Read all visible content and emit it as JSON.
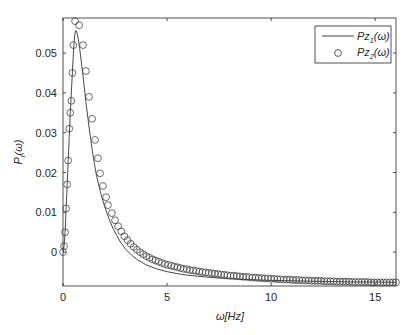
{
  "chart_data": {
    "type": "line",
    "title": "",
    "xlabel": "ω[Hz]",
    "ylabel": "P_i(ω)",
    "xlim": [
      0,
      16
    ],
    "ylim": [
      -0.0085,
      0.0588
    ],
    "xticks": [
      0,
      5,
      10,
      15
    ],
    "xtick_labels": [
      "0",
      "5",
      "10",
      "15"
    ],
    "yticks": [
      0,
      0.01,
      0.02,
      0.03,
      0.04,
      0.05
    ],
    "ytick_labels": [
      "0",
      "0.01",
      "0.02",
      "0.03",
      "0.04",
      "0.05"
    ],
    "grid": false,
    "legend_position": "upper right",
    "series": [
      {
        "name": "Pz1(ω)",
        "label_main": "Pz",
        "label_sub": "1",
        "label_tail": "(ω)",
        "style": "line",
        "color": "#333333",
        "x": [
          0,
          0.05,
          0.1,
          0.15,
          0.2,
          0.25,
          0.3,
          0.35,
          0.4,
          0.45,
          0.5,
          0.55,
          0.6,
          0.65,
          0.7,
          0.75,
          0.8,
          0.9,
          1.0,
          1.1,
          1.2,
          1.3,
          1.4,
          1.5,
          1.6,
          1.8,
          2.0,
          2.2,
          2.4,
          2.6,
          2.8,
          3.0,
          3.3,
          3.6,
          4.0,
          4.5,
          5.0,
          5.5,
          6.0,
          7.0,
          8.0,
          9.0,
          10.0,
          11.0,
          12.0,
          13.0,
          14.0,
          15.0,
          16.0
        ],
        "y": [
          0.0,
          0.0015,
          0.005,
          0.011,
          0.017,
          0.023,
          0.029,
          0.035,
          0.04,
          0.045,
          0.05,
          0.054,
          0.0556,
          0.0555,
          0.0545,
          0.053,
          0.0512,
          0.047,
          0.0425,
          0.0378,
          0.0335,
          0.0295,
          0.0258,
          0.0225,
          0.0195,
          0.015,
          0.0115,
          0.0085,
          0.006,
          0.004,
          0.0022,
          0.0008,
          -0.0008,
          -0.002,
          -0.0032,
          -0.0042,
          -0.0049,
          -0.0054,
          -0.0058,
          -0.0063,
          -0.0067,
          -0.0069,
          -0.0071,
          -0.0072,
          -0.0073,
          -0.0074,
          -0.0075,
          -0.0075,
          -0.0076
        ]
      },
      {
        "name": "Pz2(ω)",
        "label_main": "Pz",
        "label_sub": "2",
        "label_tail": "(ω)",
        "style": "markers-circle",
        "color": "#333333",
        "x": [
          0,
          0.05,
          0.1,
          0.15,
          0.2,
          0.25,
          0.3,
          0.35,
          0.4,
          0.45,
          0.5,
          0.58,
          0.77,
          0.96,
          1.1,
          1.25,
          1.4,
          1.54,
          1.68,
          1.78,
          1.92,
          2.07,
          2.16,
          2.35,
          2.5,
          2.65,
          2.8,
          2.95,
          3.1,
          3.25,
          3.4,
          3.55,
          3.7,
          3.85,
          4.0,
          4.15,
          4.3,
          4.45,
          4.6,
          4.75,
          4.9,
          5.05,
          5.2,
          5.35,
          5.5,
          5.65,
          5.8,
          5.95,
          6.1,
          6.25,
          6.4,
          6.55,
          6.7,
          6.85,
          7.0,
          7.15,
          7.3,
          7.45,
          7.6,
          7.75,
          7.9,
          8.05,
          8.2,
          8.35,
          8.5,
          8.65,
          8.8,
          8.95,
          9.1,
          9.25,
          9.4,
          9.55,
          9.7,
          9.85,
          10.0,
          10.15,
          10.3,
          10.45,
          10.6,
          10.75,
          10.9,
          11.05,
          11.2,
          11.35,
          11.5,
          11.65,
          11.8,
          11.95,
          12.1,
          12.25,
          12.4,
          12.55,
          12.7,
          12.85,
          13.0,
          13.15,
          13.3,
          13.45,
          13.6,
          13.75,
          13.9,
          14.05,
          14.2,
          14.35,
          14.5,
          14.65,
          14.8,
          14.95,
          15.1,
          15.25,
          15.4,
          15.55,
          15.7,
          15.85,
          16.0
        ],
        "y": [
          0.0,
          0.0015,
          0.005,
          0.011,
          0.017,
          0.023,
          0.031,
          0.035,
          0.038,
          0.045,
          0.052,
          0.058,
          0.057,
          0.052,
          0.0455,
          0.039,
          0.0335,
          0.0282,
          0.0236,
          0.0198,
          0.0166,
          0.0138,
          0.0118,
          0.0098,
          0.008,
          0.0065,
          0.0052,
          0.004,
          0.003,
          0.0021,
          0.0013,
          0.0006,
          0.0,
          -0.0005,
          -0.001,
          -0.0014,
          -0.0018,
          -0.0021,
          -0.0024,
          -0.0027,
          -0.003,
          -0.0032,
          -0.0034,
          -0.0036,
          -0.0038,
          -0.004,
          -0.0042,
          -0.0043,
          -0.0045,
          -0.0046,
          -0.0047,
          -0.0049,
          -0.005,
          -0.0051,
          -0.0052,
          -0.0053,
          -0.0054,
          -0.0055,
          -0.0056,
          -0.0057,
          -0.0058,
          -0.0059,
          -0.0059,
          -0.006,
          -0.0061,
          -0.0062,
          -0.0062,
          -0.0063,
          -0.0064,
          -0.0064,
          -0.0065,
          -0.0065,
          -0.0066,
          -0.0066,
          -0.0067,
          -0.0067,
          -0.0068,
          -0.0068,
          -0.0069,
          -0.0069,
          -0.0069,
          -0.007,
          -0.007,
          -0.007,
          -0.0071,
          -0.0071,
          -0.0071,
          -0.0072,
          -0.0072,
          -0.0072,
          -0.0072,
          -0.0073,
          -0.0073,
          -0.0073,
          -0.0073,
          -0.0074,
          -0.0074,
          -0.0074,
          -0.0074,
          -0.0074,
          -0.0075,
          -0.0075,
          -0.0075,
          -0.0075,
          -0.0075,
          -0.0075,
          -0.0076,
          -0.0076,
          -0.0076,
          -0.0076,
          -0.0076,
          -0.0076,
          -0.0076,
          -0.0076,
          -0.0076
        ]
      }
    ]
  },
  "layout": {
    "plot_left": 63,
    "plot_right": 396,
    "plot_top": 18,
    "plot_bottom": 286,
    "axis_color": "#262626",
    "line_color": "#333333",
    "marker_color": "#444444",
    "marker_radius": 3.4
  }
}
